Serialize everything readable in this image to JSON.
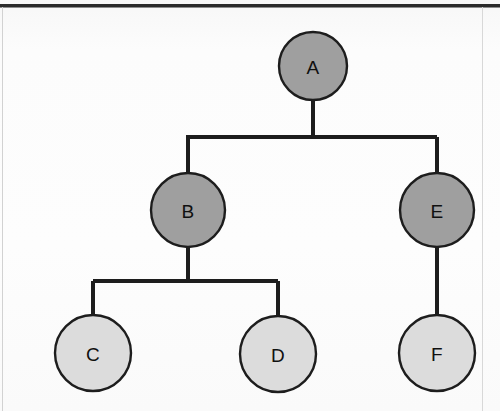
{
  "diagram": {
    "type": "tree",
    "canvas": {
      "width": 500,
      "height": 411
    },
    "colors": {
      "background": "#fbfbfb",
      "node_fill_internal": "#9f9f9f",
      "node_fill_leaf": "#dcdcdc",
      "node_stroke": "#1d1d1d",
      "edge_stroke": "#1d1d1d",
      "label_color": "#101010",
      "frame_rule": "#2b2b2b"
    },
    "nodes": [
      {
        "id": "A",
        "label": "A",
        "cx": 313,
        "cy": 66,
        "r": 34,
        "level": 0,
        "fill": "#9f9f9f",
        "role": "root"
      },
      {
        "id": "B",
        "label": "B",
        "cx": 188,
        "cy": 210,
        "r": 37,
        "level": 1,
        "fill": "#9f9f9f",
        "role": "internal"
      },
      {
        "id": "E",
        "label": "E",
        "cx": 437,
        "cy": 210,
        "r": 37,
        "level": 1,
        "fill": "#9f9f9f",
        "role": "internal"
      },
      {
        "id": "C",
        "label": "C",
        "cx": 93,
        "cy": 353,
        "r": 38,
        "level": 2,
        "fill": "#dcdcdc",
        "role": "leaf"
      },
      {
        "id": "D",
        "label": "D",
        "cx": 278,
        "cy": 354,
        "r": 38,
        "level": 2,
        "fill": "#dcdcdc",
        "role": "leaf"
      },
      {
        "id": "F",
        "label": "F",
        "cx": 437,
        "cy": 353,
        "r": 38,
        "level": 2,
        "fill": "#dcdcdc",
        "role": "leaf"
      }
    ],
    "edges": [
      {
        "id": "A-B",
        "from": "A",
        "to": "B",
        "style": "orthogonal",
        "bus_y": 137
      },
      {
        "id": "A-E",
        "from": "A",
        "to": "E",
        "style": "orthogonal",
        "bus_y": 137
      },
      {
        "id": "B-C",
        "from": "B",
        "to": "C",
        "style": "orthogonal",
        "bus_y": 281
      },
      {
        "id": "B-D",
        "from": "B",
        "to": "D",
        "style": "orthogonal",
        "bus_y": 281
      },
      {
        "id": "E-F",
        "from": "E",
        "to": "F",
        "style": "straight",
        "bus_y": null
      }
    ],
    "edge_paths": {
      "a_stem": "M 313 100 L 313 137",
      "bus_top": "M 186 137 L 437 137",
      "b_drop": "M 188 137 L 188 173",
      "e_drop": "M 437 137 L 437 173",
      "b_stem": "M 188 247 L 188 281",
      "bus_bottom": "M 93 281 L 278 281",
      "c_drop": "M 93 281 L 93 316",
      "d_drop": "M 278 281 L 278 317",
      "e_f_link": "M 437 247 L 437 315"
    },
    "frame": {
      "top_rule_y": 4,
      "top_rule_height": 3,
      "left_rule_x": 2,
      "right_rule_x": 482
    }
  }
}
